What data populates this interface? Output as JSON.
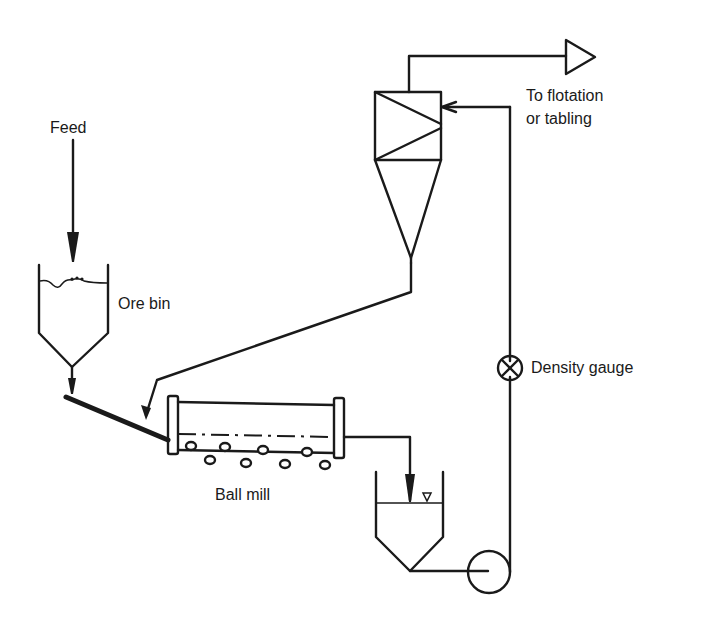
{
  "diagram": {
    "type": "process-flow",
    "colors": {
      "line": "#1a1a1a",
      "background": "#ffffff"
    },
    "labels": {
      "feed": "Feed",
      "ore_bin": "Ore bin",
      "ball_mill": "Ball mill",
      "density_gauge": "Density gauge",
      "output_line1": "To flotation",
      "output_line2": "or tabling"
    },
    "components": [
      {
        "id": "feed",
        "label": "Feed",
        "kind": "input-arrow"
      },
      {
        "id": "ore-bin",
        "label": "Ore bin",
        "kind": "hopper"
      },
      {
        "id": "feeder-chute",
        "label": "",
        "kind": "chute"
      },
      {
        "id": "ball-mill",
        "label": "Ball mill",
        "kind": "mill"
      },
      {
        "id": "sump",
        "label": "",
        "kind": "sump-tank"
      },
      {
        "id": "pump",
        "label": "",
        "kind": "pump"
      },
      {
        "id": "density-gauge",
        "label": "Density gauge",
        "kind": "instrument"
      },
      {
        "id": "hydrocyclone",
        "label": "",
        "kind": "cyclone"
      },
      {
        "id": "output",
        "label": "To flotation or tabling",
        "kind": "output-arrow"
      }
    ],
    "flows": [
      {
        "from": "feed",
        "to": "ore-bin"
      },
      {
        "from": "ore-bin",
        "to": "feeder-chute"
      },
      {
        "from": "feeder-chute",
        "to": "ball-mill"
      },
      {
        "from": "ball-mill",
        "to": "sump"
      },
      {
        "from": "sump",
        "to": "pump"
      },
      {
        "from": "pump",
        "to": "density-gauge"
      },
      {
        "from": "density-gauge",
        "to": "hydrocyclone"
      },
      {
        "from": "hydrocyclone",
        "to": "output",
        "stream": "overflow"
      },
      {
        "from": "hydrocyclone",
        "to": "ball-mill",
        "stream": "underflow"
      }
    ]
  }
}
